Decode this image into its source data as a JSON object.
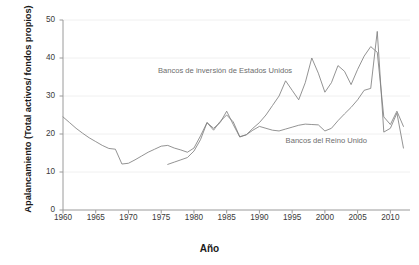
{
  "chart_data": {
    "type": "line",
    "title": "",
    "xlabel": "Año",
    "ylabel": "Apalancamiento (Total activos/ fondos propios)",
    "xlim": [
      1960,
      2013
    ],
    "ylim": [
      0,
      50
    ],
    "xticks": [
      1960,
      1965,
      1970,
      1975,
      1980,
      1985,
      1990,
      1995,
      2000,
      2005,
      2010
    ],
    "yticks": [
      0,
      10,
      20,
      30,
      40,
      50
    ],
    "grid": "horizontal",
    "legend_position": "inline-annotations",
    "line_color": "#808080",
    "series": [
      {
        "name": "Bancos de inversión de Estados Unidos",
        "label_x": 1974.5,
        "label_y": 36.5,
        "x": [
          1976,
          1977,
          1978,
          1979,
          1980,
          1981,
          1982,
          1983,
          1984,
          1985,
          1986,
          1987,
          1988,
          1989,
          1990,
          1991,
          1992,
          1993,
          1994,
          1995,
          1996,
          1997,
          1998,
          1999,
          2000,
          2001,
          2002,
          2003,
          2004,
          2005,
          2006,
          2007,
          2008,
          2009,
          2010,
          2011,
          2012
        ],
        "y": [
          12.0,
          12.6,
          13.2,
          13.8,
          15.5,
          18.5,
          23.0,
          21.5,
          23.0,
          26.0,
          22.5,
          19.2,
          19.8,
          21.5,
          23.0,
          25.0,
          27.5,
          30.0,
          34.0,
          31.5,
          29.0,
          33.5,
          40.0,
          36.0,
          31.0,
          33.5,
          38.0,
          36.5,
          33.0,
          37.0,
          40.5,
          43.0,
          41.5,
          24.5,
          22.5,
          26.0,
          22.0
        ]
      },
      {
        "name": "Bancos del Reino Unido",
        "label_x": 1994.0,
        "label_y": 18.2,
        "x": [
          1960,
          1961,
          1962,
          1963,
          1964,
          1965,
          1966,
          1967,
          1968,
          1969,
          1970,
          1971,
          1972,
          1973,
          1974,
          1975,
          1976,
          1977,
          1978,
          1979,
          1980,
          1981,
          1982,
          1983,
          1984,
          1985,
          1986,
          1987,
          1988,
          1989,
          1990,
          1991,
          1992,
          1993,
          1994,
          1995,
          1996,
          1997,
          1998,
          1999,
          2000,
          2001,
          2002,
          2003,
          2004,
          2005,
          2006,
          2007,
          2008,
          2009,
          2010,
          2011,
          2012
        ],
        "y": [
          24.5,
          23.0,
          21.5,
          20.2,
          19.0,
          18.0,
          17.0,
          16.2,
          16.0,
          12.1,
          12.3,
          13.2,
          14.2,
          15.2,
          16.0,
          16.8,
          17.0,
          16.3,
          15.8,
          15.2,
          16.3,
          19.5,
          23.0,
          21.0,
          23.3,
          25.0,
          23.2,
          19.3,
          19.8,
          21.0,
          22.0,
          21.5,
          21.0,
          20.8,
          21.3,
          21.8,
          22.3,
          22.6,
          22.5,
          22.4,
          20.8,
          21.5,
          23.5,
          25.3,
          27.0,
          29.0,
          31.5,
          32.0,
          47.0,
          20.5,
          21.5,
          25.5,
          16.3
        ]
      }
    ]
  }
}
